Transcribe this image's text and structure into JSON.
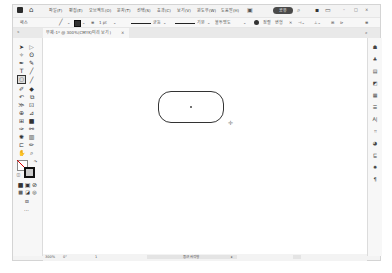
{
  "menubar": {
    "items": [
      "파일(F)",
      "편집(E)",
      "오브젝트(O)",
      "문자(T)",
      "선택(S)",
      "효과(C)",
      "보기(V)",
      "윈도우(W)",
      "도움말(H)"
    ],
    "share_label": "공유",
    "window_controls": [
      "minimize-icon",
      "maximize-icon",
      "close-icon"
    ]
  },
  "controlbar": {
    "selection_label": "패스",
    "stroke_weight": "1 pt",
    "brush_label": "균등",
    "profile_label": "기본",
    "style_label": "불투명도",
    "opacity_items": [
      "정렬",
      "변형"
    ]
  },
  "tab": {
    "title": "무제-1* @ 300%(CMYK/미리 보기)",
    "close": "×"
  },
  "canvas": {
    "shape": "rounded-rectangle"
  },
  "statusbar": {
    "zoom": "300%",
    "rotation": "0°",
    "artboard": "1",
    "tool_label": "둥근 사각형"
  },
  "tools": [
    "selection",
    "direct-selection",
    "magic-wand",
    "lasso",
    "pen",
    "curvature",
    "type",
    "line",
    "rounded-rectangle",
    "paintbrush",
    "pencil",
    "shaper",
    "rotate",
    "scale",
    "width",
    "free-transform",
    "shape-builder",
    "perspective",
    "mesh",
    "gradient",
    "eyedropper",
    "blend",
    "symbol-sprayer",
    "column-graph",
    "artboard",
    "slice",
    "hand",
    "zoom"
  ],
  "right_panel_icons": [
    "properties",
    "layers",
    "libraries",
    "color",
    "swatches",
    "stroke",
    "character",
    "transform",
    "appearance",
    "align",
    "pathfinder",
    "brushes"
  ]
}
